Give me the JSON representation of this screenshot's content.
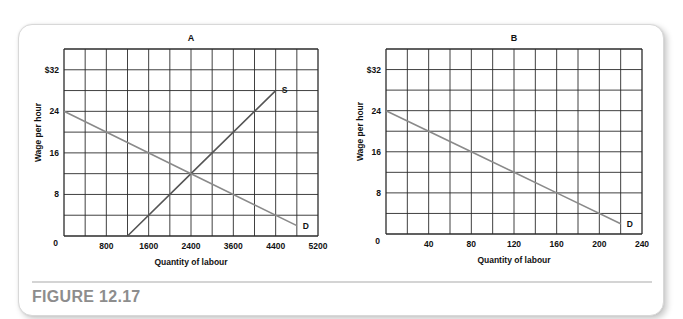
{
  "figure_label": "FIGURE 12.17",
  "colors": {
    "grid": "#2b2b2b",
    "supply_line": "#555555",
    "demand_line": "#8a8a8a",
    "caption": "#8d8d8d"
  },
  "chart_data": [
    {
      "type": "line",
      "title": "A",
      "xlabel": "Quantity of labour",
      "ylabel": "Wage per hour",
      "x_tick_labels": [
        "0",
        "800",
        "1600",
        "2400",
        "3600",
        "4400",
        "5200"
      ],
      "y_tick_labels": [
        "0",
        "8",
        "16",
        "24",
        "$32"
      ],
      "xlim": [
        0,
        4800
      ],
      "ylim": [
        0,
        36
      ],
      "grid": true,
      "grid_columns": 12,
      "grid_rows": 9,
      "series": [
        {
          "name": "S",
          "label": "S",
          "points": [
            [
              1200,
              0
            ],
            [
              2400,
              12
            ],
            [
              4000,
              28
            ]
          ]
        },
        {
          "name": "D",
          "label": "D",
          "points": [
            [
              0,
              24
            ],
            [
              2400,
              12
            ],
            [
              4400,
              2
            ]
          ]
        }
      ],
      "annotations": [
        "S",
        "D"
      ],
      "equilibrium": {
        "quantity": 2400,
        "wage": 12
      }
    },
    {
      "type": "line",
      "title": "B",
      "xlabel": "Quantity of labour",
      "ylabel": "Wage per hour",
      "x_tick_labels": [
        "0",
        "40",
        "80",
        "120",
        "160",
        "200",
        "240"
      ],
      "y_tick_labels": [
        "0",
        "8",
        "16",
        "24",
        "$32"
      ],
      "xlim": [
        0,
        240
      ],
      "ylim": [
        0,
        36
      ],
      "grid": true,
      "grid_columns": 12,
      "grid_rows": 9,
      "series": [
        {
          "name": "D",
          "label": "D",
          "points": [
            [
              0,
              24
            ],
            [
              80,
              16
            ],
            [
              120,
              12
            ],
            [
              160,
              8
            ],
            [
              220,
              2
            ]
          ]
        }
      ],
      "annotations": [
        "D"
      ]
    }
  ]
}
